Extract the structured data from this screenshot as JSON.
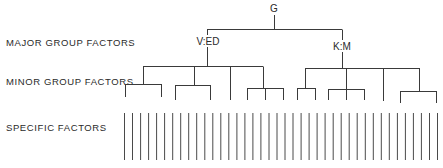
{
  "row_labels": {
    "major": "MAJOR GROUP FACTORS",
    "minor": "MINOR GROUP FACTORS",
    "specific": "SPECIFIC FACTORS"
  },
  "nodes": {
    "root": "G",
    "major_left": "V:ED",
    "major_right": "K:M"
  },
  "structure": {
    "root": "G",
    "major_groups": [
      {
        "label": "V:ED",
        "minor_groups": [
          {
            "children": 2
          },
          {
            "children": 2
          },
          {
            "children": 1
          },
          {
            "children": 3
          }
        ]
      },
      {
        "label": "K:M",
        "minor_groups": [
          {
            "children": 2
          },
          {
            "children": 3
          },
          {
            "children": 1
          },
          {
            "children": 2
          }
        ]
      }
    ],
    "specific_factor_count": 40
  },
  "colors": {
    "line": "#3a3a3a",
    "background": "#ffffff"
  }
}
